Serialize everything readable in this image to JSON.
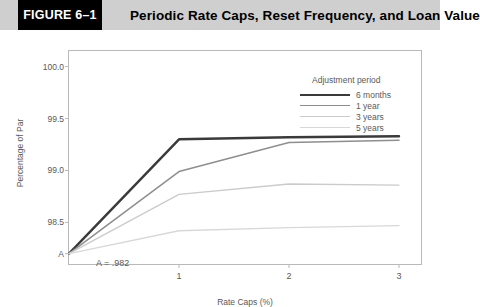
{
  "header": {
    "figure_number": "FIGURE 6–1",
    "title": "Periodic Rate Caps, Reset Frequency, and Loan Value",
    "bar_color": "#cfcfcf",
    "box_color": "#000000"
  },
  "footer": {
    "note": ""
  },
  "chart_data": {
    "type": "line",
    "title": "Periodic Rate Caps, Reset Frequency, and Loan Value",
    "xlabel": "Rate Caps (%)",
    "ylabel": "Percentage of Par",
    "x": [
      0,
      1,
      2,
      3
    ],
    "xticks": [
      1,
      2,
      3
    ],
    "xtick_labels": [
      "1",
      "2",
      "3"
    ],
    "xlim": [
      0,
      3.2
    ],
    "yticks": [
      98.2,
      98.5,
      99.0,
      99.5,
      100.0
    ],
    "ytick_labels": [
      "A",
      "98.5",
      "99.0",
      "99.5",
      "100.0"
    ],
    "ylim": [
      98.1,
      100.15
    ],
    "grid": false,
    "legend_title": "Adjustment period",
    "legend_position": "upper right",
    "annotations": [
      {
        "text": "A = .982",
        "x": 0.42,
        "y": 98.23
      }
    ],
    "series": [
      {
        "name": "6 months",
        "color": "#3a3a3a",
        "width": 2.4,
        "values": [
          98.2,
          99.3,
          99.32,
          99.33
        ]
      },
      {
        "name": "1 year",
        "color": "#8e8e8e",
        "width": 1.5,
        "values": [
          98.2,
          98.99,
          99.27,
          99.29
        ]
      },
      {
        "name": "3 years",
        "color": "#cbcbcb",
        "width": 1.3,
        "values": [
          98.2,
          98.77,
          98.87,
          98.86
        ]
      },
      {
        "name": "5 years",
        "color": "#d8d8d8",
        "width": 1.3,
        "values": [
          98.2,
          98.42,
          98.45,
          98.47
        ]
      }
    ]
  }
}
